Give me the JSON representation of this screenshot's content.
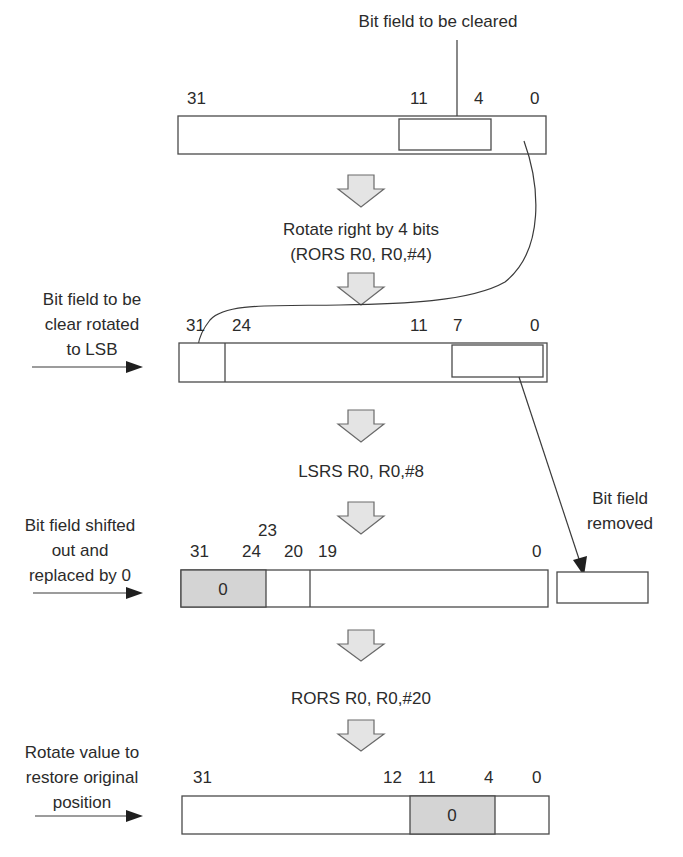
{
  "diagram": {
    "title_top": "Bit field to be cleared",
    "colors": {
      "stroke": "#4a4a4a",
      "shaded_field": "#d4d4d4",
      "block_arrow_fill": "#e4e4e4",
      "text": "#2b2b2b"
    },
    "steps": [
      {
        "id": "original",
        "bit_labels": [
          {
            "text": "31",
            "x": 187
          },
          {
            "text": "11",
            "x": 410
          },
          {
            "text": "4",
            "x": 475
          },
          {
            "text": "0",
            "x": 532
          }
        ],
        "highlighted_field": {
          "from_bit": 11,
          "to_bit": 4
        }
      },
      {
        "id": "rotated",
        "operation_lines": [
          "Rotate right by 4 bits",
          "(RORS  R0, R0,#4)"
        ],
        "side_label_lines": [
          "Bit field to be",
          "clear rotated",
          "to LSB"
        ],
        "bit_labels": [
          {
            "text": "31",
            "x": 186
          },
          {
            "text": "24",
            "x": 233
          },
          {
            "text": "11",
            "x": 411
          },
          {
            "text": "7",
            "x": 455
          },
          {
            "text": "0",
            "x": 532
          }
        ],
        "highlighted_field": {
          "from_bit": 7,
          "to_bit": 0
        }
      },
      {
        "id": "shifted",
        "operation_lines": [
          "LSRS  R0, R0,#8"
        ],
        "side_label_lines": [
          "Bit field shifted",
          "out and",
          "replaced by 0"
        ],
        "bit_labels": [
          {
            "text": "31",
            "x": 190
          },
          {
            "text": "24",
            "x": 245
          },
          {
            "text": "23",
            "x": 262,
            "raised": true
          },
          {
            "text": "20",
            "x": 285
          },
          {
            "text": "19",
            "x": 320
          },
          {
            "text": "0",
            "x": 534
          }
        ],
        "zero_field_value": "0",
        "removed_label_lines": [
          "Bit field",
          "removed"
        ]
      },
      {
        "id": "restored",
        "operation_lines": [
          "RORS  R0, R0,#20"
        ],
        "side_label_lines": [
          "Rotate value to",
          "restore original",
          "position"
        ],
        "bit_labels": [
          {
            "text": "31",
            "x": 193
          },
          {
            "text": "12",
            "x": 385
          },
          {
            "text": "11",
            "x": 420
          },
          {
            "text": "4",
            "x": 485
          },
          {
            "text": "0",
            "x": 535
          }
        ],
        "zero_field_value": "0"
      }
    ]
  }
}
